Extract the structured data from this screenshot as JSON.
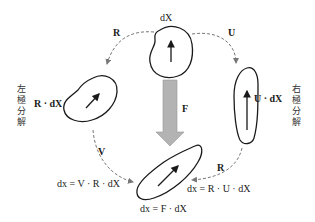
{
  "diagram": {
    "nodes": {
      "reference": {
        "label": "dX"
      },
      "left_intermediate": {
        "label": "R · dX"
      },
      "right_intermediate": {
        "label": "U · dX"
      },
      "current": {
        "label": "dx = F · dX"
      }
    },
    "edges": {
      "top_left": {
        "label": "R"
      },
      "top_right": {
        "label": "U"
      },
      "center": {
        "label": "F"
      },
      "bottom_left": {
        "label": "V"
      },
      "bottom_right": {
        "label": "R"
      }
    },
    "equations": {
      "left": "dx = V · R · dX",
      "right": "dx = R · U · dX"
    },
    "side_labels": {
      "left": [
        "左",
        "極",
        "分",
        "解"
      ],
      "right": [
        "右",
        "極",
        "分",
        "解"
      ]
    },
    "colors": {
      "stroke": "#1a1a1a",
      "dashed": "#777777",
      "big_arrow": "#b3b3b3"
    }
  }
}
